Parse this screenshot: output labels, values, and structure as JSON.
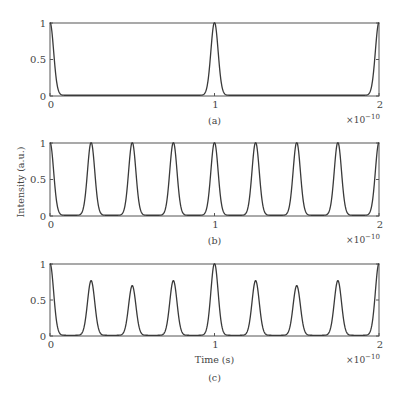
{
  "figure": {
    "ylabel": "Intensity (a.u.)",
    "xlabel": "Time (s)",
    "x_exponent_label": "×10",
    "x_exponent_power": "−10"
  },
  "chart_data": [
    {
      "type": "line",
      "panel_label": "(a)",
      "xlabel": "",
      "ylabel": "",
      "xlim": [
        0,
        2e-10
      ],
      "ylim": [
        0,
        1
      ],
      "x_ticks": [
        "0",
        "1",
        "2"
      ],
      "y_ticks": [
        "0",
        "0.5",
        "1"
      ],
      "x_scale_label": "×10^-10",
      "pulse_period": 1e-10,
      "peaks": [
        {
          "t": 0,
          "intensity": 1
        },
        {
          "t": 1e-10,
          "intensity": 1
        },
        {
          "t": 2e-10,
          "intensity": 1
        }
      ]
    },
    {
      "type": "line",
      "panel_label": "(b)",
      "xlabel": "",
      "ylabel": "Intensity (a.u.)",
      "xlim": [
        0,
        2e-10
      ],
      "ylim": [
        0,
        1
      ],
      "x_ticks": [
        "0",
        "1",
        "2"
      ],
      "y_ticks": [
        "0",
        "0.5",
        "1"
      ],
      "x_scale_label": "×10^-10",
      "pulse_period": 2.5e-11,
      "peaks": [
        {
          "t": 0,
          "intensity": 1
        },
        {
          "t": 2.5e-11,
          "intensity": 1
        },
        {
          "t": 5e-11,
          "intensity": 1
        },
        {
          "t": 7.5e-11,
          "intensity": 1
        },
        {
          "t": 1e-10,
          "intensity": 1
        },
        {
          "t": 1.25e-10,
          "intensity": 1
        },
        {
          "t": 1.5e-10,
          "intensity": 1
        },
        {
          "t": 1.75e-10,
          "intensity": 1
        },
        {
          "t": 2e-10,
          "intensity": 1
        }
      ]
    },
    {
      "type": "line",
      "panel_label": "(c)",
      "xlabel": "Time (s)",
      "ylabel": "",
      "xlim": [
        0,
        2e-10
      ],
      "ylim": [
        0,
        1
      ],
      "x_ticks": [
        "0",
        "1",
        "2"
      ],
      "y_ticks": [
        "0",
        "0.5",
        "1"
      ],
      "x_scale_label": "×10^-10",
      "pulse_period": 2.5e-11,
      "peaks": [
        {
          "t": 0,
          "intensity": 1
        },
        {
          "t": 2.5e-11,
          "intensity": 0.76
        },
        {
          "t": 5e-11,
          "intensity": 0.69
        },
        {
          "t": 7.5e-11,
          "intensity": 0.76
        },
        {
          "t": 1e-10,
          "intensity": 1
        },
        {
          "t": 1.25e-10,
          "intensity": 0.76
        },
        {
          "t": 1.5e-10,
          "intensity": 0.69
        },
        {
          "t": 1.75e-10,
          "intensity": 0.76
        },
        {
          "t": 2e-10,
          "intensity": 1
        }
      ]
    }
  ]
}
